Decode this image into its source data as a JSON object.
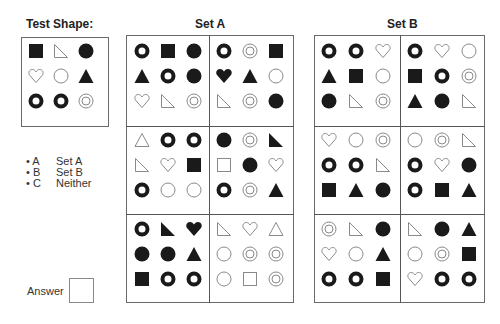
{
  "test_shape": {
    "title": "Test Shape:",
    "grid": [
      [
        "sq-f",
        "rtri-o",
        "circ-f"
      ],
      [
        "heart-o",
        "circ-o",
        "tri-f"
      ],
      [
        "ring",
        "ring",
        "target"
      ]
    ]
  },
  "set_a": {
    "title": "Set A",
    "panels": [
      [
        [
          "ring",
          "sq-f",
          "circ-f"
        ],
        [
          "tri-f",
          "ring",
          "circ-f"
        ],
        [
          "heart-o",
          "rtri-o",
          "target"
        ]
      ],
      [
        [
          "ring",
          "target",
          "sq-f"
        ],
        [
          "heart-f",
          "tri-f",
          "circ-o"
        ],
        [
          "rtri-o",
          "target",
          "circ-f"
        ]
      ],
      [
        [
          "tri-o",
          "ring",
          "ring"
        ],
        [
          "rtri-o",
          "heart-o",
          "sq-f"
        ],
        [
          "ring",
          "circ-o",
          "circ-o"
        ]
      ],
      [
        [
          "circ-f",
          "target",
          "rtri-f"
        ],
        [
          "sq-o",
          "circ-f",
          "heart-o"
        ],
        [
          "ring",
          "target",
          "tri-f"
        ]
      ],
      [
        [
          "ring",
          "rtri-f",
          "heart-f"
        ],
        [
          "circ-f",
          "circ-f",
          "tri-f"
        ],
        [
          "sq-f",
          "ring",
          "ring"
        ]
      ],
      [
        [
          "rtri-o",
          "heart-o",
          "tri-o"
        ],
        [
          "circ-o",
          "target",
          "target"
        ],
        [
          "circ-o",
          "sq-o",
          "target"
        ]
      ]
    ]
  },
  "set_b": {
    "title": "Set B",
    "panels": [
      [
        [
          "ring",
          "ring",
          "heart-o"
        ],
        [
          "tri-f",
          "sq-f",
          "circ-o"
        ],
        [
          "circ-f",
          "rtri-o",
          "target"
        ]
      ],
      [
        [
          "ring",
          "heart-o",
          "circ-o"
        ],
        [
          "sq-f",
          "ring",
          "target"
        ],
        [
          "tri-f",
          "circ-f",
          "rtri-o"
        ]
      ],
      [
        [
          "heart-o",
          "circ-o",
          "target"
        ],
        [
          "ring",
          "ring",
          "rtri-o"
        ],
        [
          "sq-f",
          "tri-f",
          "circ-f"
        ]
      ],
      [
        [
          "circ-o",
          "target",
          "rtri-o"
        ],
        [
          "ring",
          "heart-o",
          "circ-f"
        ],
        [
          "ring",
          "sq-f",
          "tri-f"
        ]
      ],
      [
        [
          "target",
          "rtri-o",
          "circ-f"
        ],
        [
          "heart-o",
          "circ-o",
          "tri-f"
        ],
        [
          "ring",
          "ring",
          "sq-f"
        ]
      ],
      [
        [
          "rtri-o",
          "circ-f",
          "tri-f"
        ],
        [
          "circ-o",
          "target",
          "sq-f"
        ],
        [
          "heart-o",
          "ring",
          "ring"
        ]
      ]
    ]
  },
  "options": [
    {
      "key": "• A",
      "label": "Set A"
    },
    {
      "key": "• B",
      "label": "Set B"
    },
    {
      "key": "• C",
      "label": "Neither"
    }
  ],
  "answer": {
    "label": "Answer",
    "value": ""
  }
}
